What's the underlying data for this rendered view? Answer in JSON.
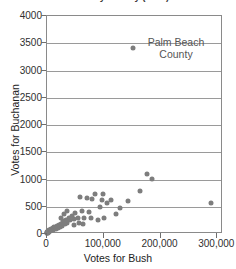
{
  "chart_data": {
    "type": "scatter",
    "title": "Votes by County (2000)",
    "xlabel": "Votes for Bush",
    "ylabel": "Votes for Buchanan",
    "xlim": [
      0,
      310000
    ],
    "ylim": [
      0,
      4000
    ],
    "xticks": [
      0,
      100000,
      200000,
      300000
    ],
    "xtick_labels": [
      "0",
      "100,000",
      "200,000",
      "300,000"
    ],
    "yticks": [
      0,
      500,
      1000,
      1500,
      2000,
      2500,
      3000,
      3500,
      4000
    ],
    "ytick_labels": [
      "0",
      "500",
      "1000",
      "1500",
      "2000",
      "2500",
      "3000",
      "3500",
      "4000"
    ],
    "grid": "horizontal",
    "legend": "none",
    "marker_color": "#7d7d7d",
    "annotations": [
      {
        "text": "Palm Beach County",
        "line1": "Palm Beach",
        "line2": "County",
        "x": 152000,
        "y": 3410
      }
    ],
    "points": [
      {
        "x": 152000,
        "y": 3410,
        "label": "Palm Beach"
      },
      {
        "x": 289000,
        "y": 560,
        "label": ""
      },
      {
        "x": 185000,
        "y": 1010,
        "label": ""
      },
      {
        "x": 177000,
        "y": 1100,
        "label": ""
      },
      {
        "x": 163000,
        "y": 790,
        "label": ""
      },
      {
        "x": 142000,
        "y": 600,
        "label": ""
      },
      {
        "x": 128000,
        "y": 480,
        "label": ""
      },
      {
        "x": 122000,
        "y": 360,
        "label": ""
      },
      {
        "x": 113000,
        "y": 620,
        "label": ""
      },
      {
        "x": 106000,
        "y": 560,
        "label": ""
      },
      {
        "x": 99000,
        "y": 730,
        "label": ""
      },
      {
        "x": 96000,
        "y": 620,
        "label": ""
      },
      {
        "x": 93000,
        "y": 490,
        "label": ""
      },
      {
        "x": 90000,
        "y": 255,
        "label": ""
      },
      {
        "x": 84000,
        "y": 730,
        "label": ""
      },
      {
        "x": 80000,
        "y": 640,
        "label": ""
      },
      {
        "x": 78000,
        "y": 300,
        "label": ""
      },
      {
        "x": 74000,
        "y": 400,
        "label": ""
      },
      {
        "x": 70000,
        "y": 660,
        "label": ""
      },
      {
        "x": 66000,
        "y": 300,
        "label": ""
      },
      {
        "x": 62000,
        "y": 420,
        "label": ""
      },
      {
        "x": 58000,
        "y": 680,
        "label": ""
      },
      {
        "x": 54000,
        "y": 300,
        "label": ""
      },
      {
        "x": 50000,
        "y": 380,
        "label": ""
      },
      {
        "x": 47000,
        "y": 280,
        "label": ""
      },
      {
        "x": 44000,
        "y": 330,
        "label": ""
      },
      {
        "x": 41000,
        "y": 250,
        "label": ""
      },
      {
        "x": 38000,
        "y": 300,
        "label": ""
      },
      {
        "x": 36000,
        "y": 210,
        "label": ""
      },
      {
        "x": 33000,
        "y": 260,
        "label": ""
      },
      {
        "x": 31000,
        "y": 180,
        "label": ""
      },
      {
        "x": 29000,
        "y": 240,
        "label": ""
      },
      {
        "x": 27000,
        "y": 150,
        "label": ""
      },
      {
        "x": 25000,
        "y": 190,
        "label": ""
      },
      {
        "x": 23000,
        "y": 130,
        "label": ""
      },
      {
        "x": 21000,
        "y": 170,
        "label": ""
      },
      {
        "x": 19000,
        "y": 110,
        "label": ""
      },
      {
        "x": 17000,
        "y": 150,
        "label": ""
      },
      {
        "x": 15000,
        "y": 95,
        "label": ""
      },
      {
        "x": 13000,
        "y": 130,
        "label": ""
      },
      {
        "x": 11000,
        "y": 80,
        "label": ""
      },
      {
        "x": 10000,
        "y": 110,
        "label": ""
      },
      {
        "x": 8500,
        "y": 70,
        "label": ""
      },
      {
        "x": 7000,
        "y": 95,
        "label": ""
      },
      {
        "x": 6000,
        "y": 55,
        "label": ""
      },
      {
        "x": 5000,
        "y": 80,
        "label": ""
      },
      {
        "x": 4000,
        "y": 45,
        "label": ""
      },
      {
        "x": 3200,
        "y": 65,
        "label": ""
      },
      {
        "x": 2600,
        "y": 35,
        "label": ""
      },
      {
        "x": 2000,
        "y": 50,
        "label": ""
      },
      {
        "x": 1500,
        "y": 25,
        "label": ""
      },
      {
        "x": 1100,
        "y": 40,
        "label": ""
      },
      {
        "x": 800,
        "y": 20,
        "label": ""
      },
      {
        "x": 500,
        "y": 30,
        "label": ""
      },
      {
        "x": 300,
        "y": 12,
        "label": ""
      },
      {
        "x": 150,
        "y": 22,
        "label": ""
      },
      {
        "x": 36000,
        "y": 420,
        "label": ""
      },
      {
        "x": 30000,
        "y": 360,
        "label": ""
      },
      {
        "x": 24000,
        "y": 300,
        "label": ""
      },
      {
        "x": 48000,
        "y": 170,
        "label": ""
      },
      {
        "x": 56000,
        "y": 210,
        "label": ""
      },
      {
        "x": 64000,
        "y": 180,
        "label": ""
      },
      {
        "x": 100000,
        "y": 300,
        "label": ""
      }
    ]
  }
}
